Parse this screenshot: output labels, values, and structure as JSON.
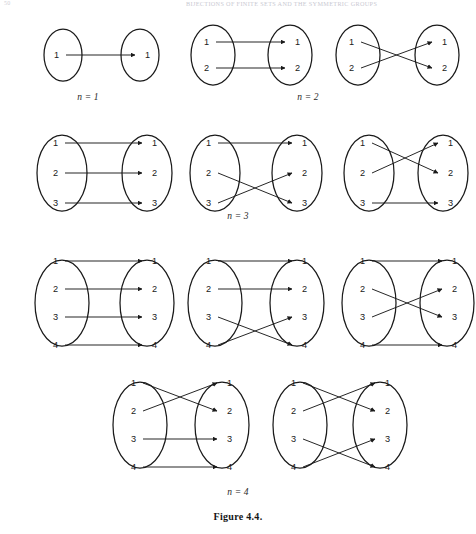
{
  "page": {
    "folio": "50",
    "running_head": "BIJECTIONS OF FINITE SETS AND THE SYMMETRIC GROUPS",
    "figure_caption": "Figure 4.4.",
    "background_color": "#ffffff",
    "ink_color": "#1a1a1a"
  },
  "labels": {
    "n1": "n = 1",
    "n2": "n = 2",
    "n3": "n = 3",
    "n4": "n = 4"
  },
  "chart_data": {
    "type": "diagram",
    "title": "Figure 4.4.",
    "groups": [
      {
        "n": 1,
        "label": "n = 1",
        "count": 1,
        "diagrams": [
          {
            "id": "n1-d1",
            "domain": [
              "1"
            ],
            "codomain": [
              "1"
            ],
            "mapping": [
              [
                1,
                1
              ]
            ],
            "cycle_notation": "e",
            "crossings": 0
          }
        ]
      },
      {
        "n": 2,
        "label": "n = 2",
        "count": 2,
        "diagrams": [
          {
            "id": "n2-d1",
            "domain": [
              "1",
              "2"
            ],
            "codomain": [
              "1",
              "2"
            ],
            "mapping": [
              [
                1,
                1
              ],
              [
                2,
                2
              ]
            ],
            "cycle_notation": "e",
            "crossings": 0
          },
          {
            "id": "n2-d2",
            "domain": [
              "1",
              "2"
            ],
            "codomain": [
              "1",
              "2"
            ],
            "mapping": [
              [
                1,
                2
              ],
              [
                2,
                1
              ]
            ],
            "cycle_notation": "(1 2)",
            "crossings": 1
          }
        ]
      },
      {
        "n": 3,
        "label": "n = 3",
        "count": 3,
        "diagrams": [
          {
            "id": "n3-d1",
            "domain": [
              "1",
              "2",
              "3"
            ],
            "codomain": [
              "1",
              "2",
              "3"
            ],
            "mapping": [
              [
                1,
                1
              ],
              [
                2,
                2
              ],
              [
                3,
                3
              ]
            ],
            "cycle_notation": "e",
            "crossings": 0
          },
          {
            "id": "n3-d2",
            "domain": [
              "1",
              "2",
              "3"
            ],
            "codomain": [
              "1",
              "2",
              "3"
            ],
            "mapping": [
              [
                1,
                1
              ],
              [
                2,
                3
              ],
              [
                3,
                2
              ]
            ],
            "cycle_notation": "(2 3)",
            "crossings": 1
          },
          {
            "id": "n3-d3",
            "domain": [
              "1",
              "2",
              "3"
            ],
            "codomain": [
              "1",
              "2",
              "3"
            ],
            "mapping": [
              [
                1,
                2
              ],
              [
                2,
                1
              ],
              [
                3,
                3
              ]
            ],
            "cycle_notation": "(1 2)",
            "crossings": 1
          }
        ]
      },
      {
        "n": 4,
        "label": "n = 4",
        "count": 5,
        "diagrams": [
          {
            "id": "n4-d1",
            "domain": [
              "1",
              "2",
              "3",
              "4"
            ],
            "codomain": [
              "1",
              "2",
              "3",
              "4"
            ],
            "mapping": [
              [
                1,
                1
              ],
              [
                2,
                2
              ],
              [
                3,
                3
              ],
              [
                4,
                4
              ]
            ],
            "cycle_notation": "e",
            "crossings": 0
          },
          {
            "id": "n4-d2",
            "domain": [
              "1",
              "2",
              "3",
              "4"
            ],
            "codomain": [
              "1",
              "2",
              "3",
              "4"
            ],
            "mapping": [
              [
                1,
                1
              ],
              [
                2,
                2
              ],
              [
                3,
                4
              ],
              [
                4,
                3
              ]
            ],
            "cycle_notation": "(3 4)",
            "crossings": 1
          },
          {
            "id": "n4-d3",
            "domain": [
              "1",
              "2",
              "3",
              "4"
            ],
            "codomain": [
              "1",
              "2",
              "3",
              "4"
            ],
            "mapping": [
              [
                1,
                1
              ],
              [
                2,
                3
              ],
              [
                3,
                2
              ],
              [
                4,
                4
              ]
            ],
            "cycle_notation": "(2 3)",
            "crossings": 1
          },
          {
            "id": "n4-d4",
            "domain": [
              "1",
              "2",
              "3",
              "4"
            ],
            "codomain": [
              "1",
              "2",
              "3",
              "4"
            ],
            "mapping": [
              [
                1,
                2
              ],
              [
                2,
                1
              ],
              [
                3,
                3
              ],
              [
                4,
                4
              ]
            ],
            "cycle_notation": "(1 2)",
            "crossings": 1
          },
          {
            "id": "n4-d5",
            "domain": [
              "1",
              "2",
              "3",
              "4"
            ],
            "codomain": [
              "1",
              "2",
              "3",
              "4"
            ],
            "mapping": [
              [
                1,
                2
              ],
              [
                2,
                1
              ],
              [
                3,
                4
              ],
              [
                4,
                3
              ]
            ],
            "cycle_notation": "(1 2)(3 4)",
            "crossings": 2
          }
        ]
      }
    ]
  }
}
